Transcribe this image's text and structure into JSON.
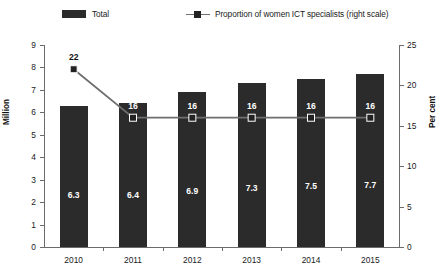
{
  "legend": {
    "items": [
      {
        "label": "Total",
        "marker": "bar-swatch-icon",
        "color": "#2b2b2b"
      },
      {
        "label": "Proportion of women ICT specialists (right scale)",
        "marker": "line-square-marker-icon",
        "color": "#6f6f6f"
      }
    ]
  },
  "chart_data": {
    "type": "bar",
    "title": "",
    "subtitle": "",
    "xlabel": "",
    "ylabel": "Million",
    "y2label": "Per cent",
    "categories": [
      "2010",
      "2011",
      "2012",
      "2013",
      "2014",
      "2015"
    ],
    "ylim": [
      0,
      9
    ],
    "yticks": [
      0,
      1,
      2,
      3,
      4,
      5,
      6,
      7,
      8,
      9
    ],
    "yticklabels": [
      "0",
      "1",
      "2",
      "3",
      "4",
      "5",
      "6",
      "7",
      "8",
      "9"
    ],
    "y2lim": [
      0,
      25
    ],
    "y2ticks": [
      0,
      5,
      10,
      15,
      20,
      25
    ],
    "y2ticklabels": [
      "0",
      "5",
      "10",
      "15",
      "20",
      "25"
    ],
    "grid": false,
    "legend_position": "top",
    "series": [
      {
        "name": "Total",
        "type": "bar",
        "axis": "left",
        "unit": "Million",
        "color": "#2b2b2b",
        "values": [
          6.3,
          6.4,
          6.9,
          7.3,
          7.5,
          7.7
        ],
        "labels": [
          "6.3",
          "6.4",
          "6.9",
          "7.3",
          "7.5",
          "7.7"
        ]
      },
      {
        "name": "Proportion of women ICT specialists (right scale)",
        "type": "line",
        "axis": "right",
        "unit": "Per cent",
        "color": "#6f6f6f",
        "marker_color": "#222222",
        "values": [
          22,
          16,
          16,
          16,
          16,
          16
        ],
        "labels": [
          "22",
          "16",
          "16",
          "16",
          "16",
          "16"
        ]
      }
    ]
  }
}
